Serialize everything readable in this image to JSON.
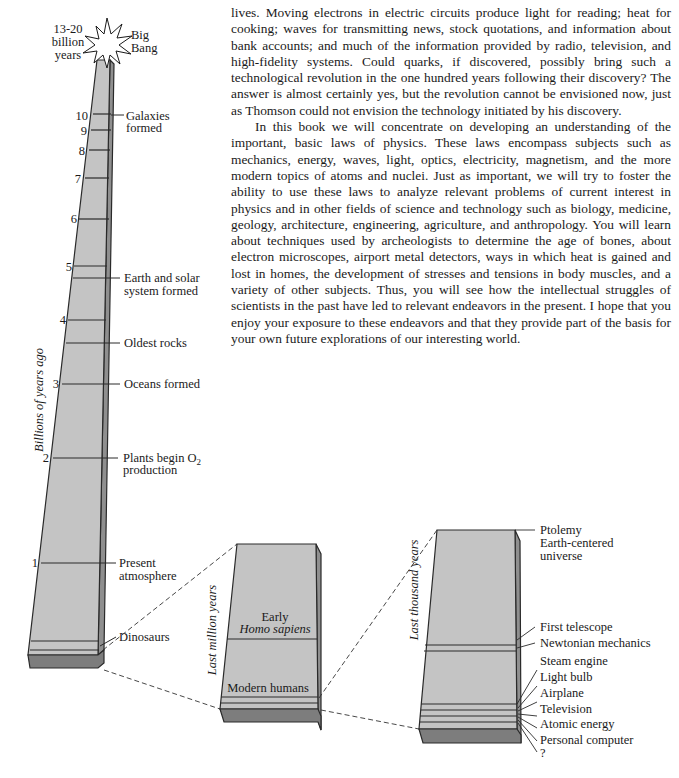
{
  "text": {
    "paragraphs": [
      "lives. Moving electrons in electric circuits produce light for reading; heat for cooking; waves for transmitting news, stock quotations, and information about bank accounts; and much of the information provided by radio, television, and high-fidelity systems. Could quarks, if discovered, possibly bring such a technological revolution in the one hundred years following their discovery? The answer is almost certainly yes, but the revolution cannot be envisioned now, just as Thomson could not envision the technology initiated by his discovery.",
      "In this book we will concentrate on developing an understanding of the important, basic laws of physics. These laws encompass subjects such as mechanics, energy, waves, light, optics, electricity, magnetism, and the more modern topics of atoms and nuclei. Just as important, we will try to foster the ability to use these laws to analyze relevant problems of current interest in physics and in other fields of science and technology such as biology, medicine, geology, architecture, engineering, agriculture, and anthropology. You will learn about techniques used by archeologists to determine the age of bones, about electron microscopes, airport metal detectors, ways in which heat is gained and lost in homes, the development of stresses and tensions in body muscles, and a variety of other subjects. Thus, you will see how the intellectual struggles of scientists in the past have led to relevant endeavors in the present. I hope that you enjoy your exposure to these endeavors and that they provide part of the basis for your own future explorations of our interesting world."
    ]
  },
  "diagram": {
    "colors": {
      "face": "#c4c4c4",
      "side": "#8f8f8f",
      "bottom": "#7d7d7d",
      "line": "#2a2a2a"
    },
    "big_bang": {
      "age_label": [
        "13-20",
        "billion",
        "years"
      ],
      "event_label": [
        "Big",
        "Bang"
      ]
    },
    "column1": {
      "axis_label": "Billions of years ago",
      "ticks": [
        "10",
        "9",
        "8",
        "7",
        "6",
        "5",
        "4",
        "3",
        "2",
        "1"
      ],
      "events": [
        {
          "lines": [
            "Galaxies",
            "formed"
          ]
        },
        {
          "lines": [
            "Earth and solar",
            "system formed"
          ]
        },
        {
          "lines": [
            "Oldest rocks"
          ]
        },
        {
          "lines": [
            "Oceans formed"
          ]
        },
        {
          "lines": [
            "Plants begin O",
            "production"
          ],
          "subscript": "2"
        },
        {
          "lines": [
            "Present",
            "atmosphere"
          ]
        },
        {
          "lines": [
            "Dinosaurs"
          ]
        }
      ]
    },
    "column2": {
      "axis_label": "Last million years",
      "events": [
        {
          "lines": [
            "Early"
          ],
          "italic_line": "Homo sapiens"
        },
        {
          "lines": [
            "Modern humans"
          ]
        }
      ]
    },
    "column3": {
      "axis_label": "Last thousand years",
      "events": [
        {
          "lines": [
            "Ptolemy",
            "Earth-centered",
            "universe"
          ]
        },
        {
          "lines": [
            "First telescope"
          ]
        },
        {
          "lines": [
            "Newtonian mechanics"
          ]
        },
        {
          "lines": [
            "Steam engine"
          ]
        },
        {
          "lines": [
            "Light bulb"
          ]
        },
        {
          "lines": [
            "Airplane"
          ]
        },
        {
          "lines": [
            "Television"
          ]
        },
        {
          "lines": [
            "Atomic energy"
          ]
        },
        {
          "lines": [
            "Personal computer"
          ]
        },
        {
          "lines": [
            "?"
          ]
        }
      ]
    }
  }
}
